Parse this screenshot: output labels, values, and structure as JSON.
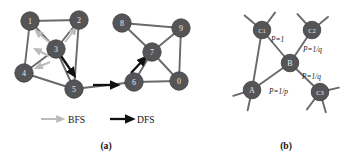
{
  "figure": {
    "panels": [
      {
        "id": "panel-a",
        "caption": "(a)",
        "nodes": [
          {
            "label": "1",
            "x": 30,
            "y": 21
          },
          {
            "label": "2",
            "x": 79,
            "y": 20
          },
          {
            "label": "3",
            "x": 56,
            "y": 49
          },
          {
            "label": "4",
            "x": 24,
            "y": 73
          },
          {
            "label": "5",
            "x": 74,
            "y": 89
          },
          {
            "label": "6",
            "x": 134,
            "y": 82
          },
          {
            "label": "7",
            "x": 152,
            "y": 52
          },
          {
            "label": "8",
            "x": 122,
            "y": 23
          },
          {
            "label": "9",
            "x": 181,
            "y": 28
          },
          {
            "label": "0",
            "x": 179,
            "y": 81
          }
        ],
        "edges": [
          [
            "1",
            "2"
          ],
          [
            "1",
            "3"
          ],
          [
            "1",
            "4"
          ],
          [
            "2",
            "3"
          ],
          [
            "2",
            "5"
          ],
          [
            "3",
            "4"
          ],
          [
            "3",
            "5"
          ],
          [
            "4",
            "5"
          ],
          [
            "5",
            "6"
          ],
          [
            "6",
            "7"
          ],
          [
            "6",
            "0"
          ],
          [
            "7",
            "8"
          ],
          [
            "7",
            "9"
          ],
          [
            "7",
            "0"
          ],
          [
            "8",
            "9"
          ],
          [
            "9",
            "0"
          ]
        ],
        "bfs_arrows": [
          {
            "x1": 50,
            "y1": 43,
            "x2": 36,
            "y2": 31
          },
          {
            "x1": 49,
            "y1": 56,
            "x2": 35,
            "y2": 49
          },
          {
            "x1": 50,
            "y1": 62,
            "x2": 36,
            "y2": 68
          },
          {
            "x1": 65,
            "y1": 42,
            "x2": 76,
            "y2": 28
          }
        ],
        "dfs_arrows": [
          {
            "x1": 61,
            "y1": 56,
            "x2": 74,
            "y2": 75
          },
          {
            "x1": 93,
            "y1": 85,
            "x2": 117,
            "y2": 85
          },
          {
            "x1": 131,
            "y1": 73,
            "x2": 145,
            "y2": 58
          }
        ]
      },
      {
        "id": "panel-b",
        "caption": "(b)",
        "nodes": [
          {
            "label": "C1",
            "x": 262,
            "y": 30
          },
          {
            "label": "C2",
            "x": 312,
            "y": 30
          },
          {
            "label": "B",
            "x": 290,
            "y": 63
          },
          {
            "label": "A",
            "x": 252,
            "y": 90
          },
          {
            "label": "C3",
            "x": 320,
            "y": 92
          }
        ],
        "edges": [
          [
            "C1",
            "B"
          ],
          [
            "C1",
            "A"
          ],
          [
            "A",
            "B"
          ],
          [
            "B",
            "C2"
          ],
          [
            "B",
            "C3"
          ]
        ],
        "stubs": [
          {
            "x": 262,
            "y": 30,
            "dx": -12,
            "dy": -10
          },
          {
            "x": 262,
            "y": 30,
            "dx": 9,
            "dy": -12
          },
          {
            "x": 312,
            "y": 30,
            "dx": -10,
            "dy": -11
          },
          {
            "x": 312,
            "y": 30,
            "dx": 11,
            "dy": -9
          },
          {
            "x": 252,
            "y": 90,
            "dx": -13,
            "dy": 4
          },
          {
            "x": 252,
            "y": 90,
            "dx": -3,
            "dy": 14
          },
          {
            "x": 320,
            "y": 92,
            "dx": 13,
            "dy": -3
          },
          {
            "x": 320,
            "y": 92,
            "dx": 4,
            "dy": 14
          },
          {
            "x": 320,
            "y": 92,
            "dx": -9,
            "dy": 12
          }
        ],
        "edge_labels": [
          {
            "text": "P=1",
            "x": 271,
            "y": 39
          },
          {
            "text": "P=1/q",
            "x": 303,
            "y": 49
          },
          {
            "text": "P=1/q",
            "x": 302,
            "y": 76
          },
          {
            "text": "P=1/p",
            "x": 269,
            "y": 91
          }
        ]
      }
    ],
    "legend": {
      "items": [
        {
          "label": "BFS",
          "kind": "bfs-arrow",
          "arrow_x1": 41,
          "arrow_x2": 63,
          "arrow_y": 119,
          "text_x": 68
        },
        {
          "label": "DFS",
          "kind": "dfs-arrow",
          "arrow_x1": 110,
          "arrow_x2": 132,
          "arrow_y": 119,
          "text_x": 137
        }
      ]
    },
    "captions": [
      {
        "text": "(a)",
        "x": 106,
        "y": 145
      },
      {
        "text": "(b)",
        "x": 286,
        "y": 145
      }
    ],
    "colors": {
      "node_fill": "#555558",
      "node_label": "#e8e8e8",
      "edge": "#6a6a6d",
      "bfs": "#bcbcbc",
      "dfs": "#111111",
      "text": "#121212",
      "background": "#ffffff"
    }
  }
}
